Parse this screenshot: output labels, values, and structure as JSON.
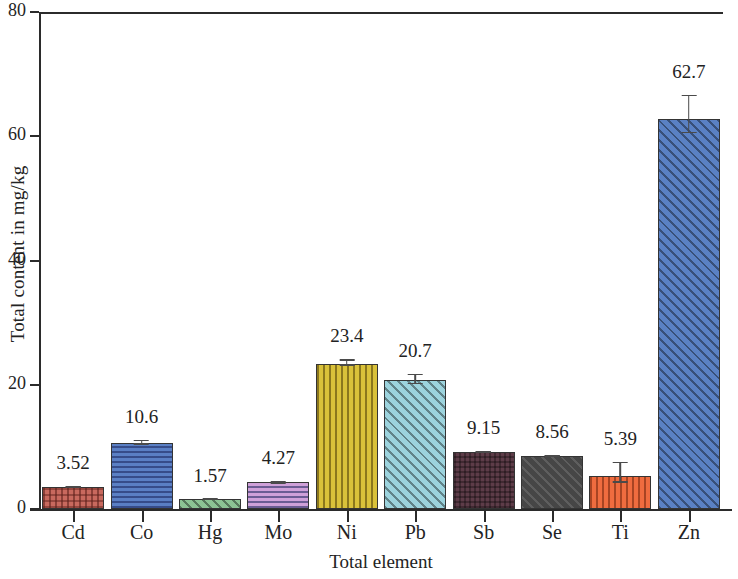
{
  "chart_data": {
    "type": "bar",
    "title": "",
    "subtitle": "",
    "xlabel": "Total element",
    "ylabel": "Total content in mg/kg",
    "categories": [
      "Cd",
      "Co",
      "Hg",
      "Mo",
      "Ni",
      "Pb",
      "Sb",
      "Se",
      "Ti",
      "Zn"
    ],
    "values": [
      3.52,
      10.6,
      1.57,
      4.27,
      23.4,
      20.7,
      9.15,
      8.56,
      5.39,
      62.7
    ],
    "value_labels": [
      "3.52",
      "10.6",
      "1.57",
      "4.27",
      "23.4",
      "20.7",
      "9.15",
      "8.56",
      "5.39",
      "62.7"
    ],
    "errors": [
      0.15,
      0.55,
      0.1,
      0.3,
      0.7,
      1.1,
      0.25,
      0.2,
      2.2,
      4.0
    ],
    "ylim": [
      0,
      80
    ],
    "yticks": [
      0,
      20,
      40,
      60,
      80
    ],
    "ytick_labels": [
      "0",
      "20",
      "40",
      "60",
      "80"
    ],
    "grid": false,
    "legend": false,
    "legend_position": "none",
    "error_bar_style": "capped-vertical",
    "bar_colors": [
      "#c8695e",
      "#5a7fc4",
      "#8cc494",
      "#cfa0d8",
      "#d9c13a",
      "#9cd3dd",
      "#5d3c48",
      "#464646",
      "#ef6c3f",
      "#5a81c4"
    ],
    "bar_patterns": [
      "dots",
      "horizontal-lines",
      "diagonal-lines",
      "horizontal-lines",
      "vertical-lines",
      "diagonal-lines",
      "cross-hatch",
      "diagonal-lines",
      "vertical-lines",
      "diagonal-lines"
    ],
    "bar_edge_color": "#343434",
    "axis_color": "#2b2b2b"
  }
}
